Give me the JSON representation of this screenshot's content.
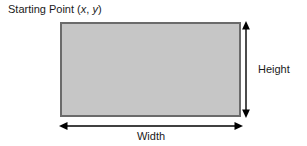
{
  "diagram": {
    "type": "rectangle-dimensions",
    "background_color": "#ffffff",
    "labels": {
      "starting_point_prefix": "Starting Point (",
      "starting_point_x": "x",
      "starting_point_comma": ", ",
      "starting_point_y": "y",
      "starting_point_suffix": ")",
      "starting_point_full": "Starting Point (x, y)",
      "height": "Height",
      "width": "Width"
    },
    "rectangle": {
      "x": 60,
      "y": 22,
      "width": 181,
      "height": 95,
      "fill_color": "#c6c6c6",
      "stroke_color": "#6b6b6b",
      "stroke_width": 2
    },
    "height_arrow": {
      "orientation": "vertical",
      "x": 246,
      "y_start": 22,
      "y_end": 117,
      "color": "#000000",
      "line_width": 1.4,
      "double_headed": true
    },
    "width_arrow": {
      "orientation": "horizontal",
      "y": 126,
      "x_start": 60,
      "x_end": 242,
      "color": "#000000",
      "line_width": 1.4,
      "double_headed": true
    },
    "text_color": "#1a1a1a",
    "font_size_px": 11
  }
}
